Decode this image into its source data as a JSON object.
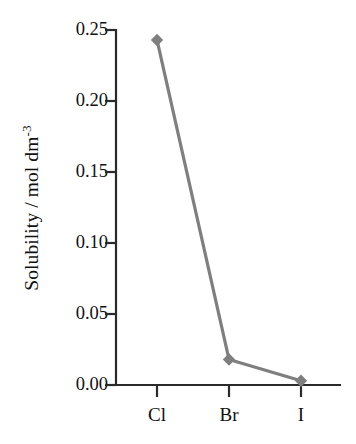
{
  "chart_data": {
    "type": "line",
    "title": "",
    "subtitle": "",
    "xlabel": "",
    "ylabel": "Solubility / mol dm",
    "ylabel_exponent": "-3",
    "ylabel_full": "Solubility / mol dm^-3",
    "categories": [
      "Cl",
      "Br",
      "I"
    ],
    "values": [
      0.243,
      0.018,
      0.003
    ],
    "series": [
      {
        "name": "Solubility",
        "values": [
          0.243,
          0.018,
          0.003
        ],
        "color": "#7f7f7f",
        "marker": "diamond"
      }
    ],
    "ylim": [
      0.0,
      0.25
    ],
    "xlim_categories": [
      "Cl",
      "Br",
      "I"
    ],
    "ytick_labels": [
      "0.00",
      "0.05",
      "0.10",
      "0.15",
      "0.20",
      "0.25"
    ],
    "ytick_values": [
      0.0,
      0.05,
      0.1,
      0.15,
      0.2,
      0.25
    ],
    "xtick_labels": [
      "Cl",
      "Br",
      "I"
    ],
    "grid": false,
    "legend": false,
    "legend_position": "none",
    "annotations": []
  },
  "style": {
    "line_color": "#7f7f7f",
    "marker_color": "#7f7f7f",
    "axis_color": "#2a2a2a",
    "text_color": "#111111",
    "background": "#ffffff"
  }
}
